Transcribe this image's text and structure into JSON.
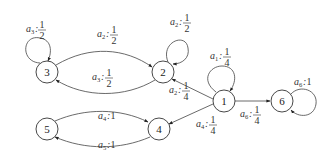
{
  "diagram": {
    "type": "markov-decision-graph",
    "nodes": [
      {
        "id": "1",
        "label": "1",
        "x": 224,
        "y": 101
      },
      {
        "id": "2",
        "label": "2",
        "x": 163,
        "y": 72
      },
      {
        "id": "3",
        "label": "3",
        "x": 47,
        "y": 72
      },
      {
        "id": "4",
        "label": "4",
        "x": 159,
        "y": 129
      },
      {
        "id": "5",
        "label": "5",
        "x": 47,
        "y": 129
      },
      {
        "id": "6",
        "label": "6",
        "x": 282,
        "y": 101
      }
    ],
    "edges": [
      {
        "from": "3",
        "to": "3",
        "action": "a",
        "sub": "3",
        "num": "1",
        "den": "2",
        "kind": "self-loop"
      },
      {
        "from": "3",
        "to": "2",
        "action": "a",
        "sub": "2",
        "num": "1",
        "den": "2",
        "kind": "arc-top"
      },
      {
        "from": "2",
        "to": "3",
        "action": "a",
        "sub": "3",
        "num": "1",
        "den": "2",
        "kind": "arc-bottom"
      },
      {
        "from": "2",
        "to": "2",
        "action": "a",
        "sub": "2",
        "num": "1",
        "den": "2",
        "kind": "self-loop"
      },
      {
        "from": "1",
        "to": "1",
        "action": "a",
        "sub": "1",
        "num": "1",
        "den": "4",
        "kind": "self-loop"
      },
      {
        "from": "1",
        "to": "2",
        "action": "a",
        "sub": "2",
        "num": "1",
        "den": "4",
        "kind": "straight"
      },
      {
        "from": "1",
        "to": "4",
        "action": "a",
        "sub": "4",
        "num": "1",
        "den": "4",
        "kind": "straight"
      },
      {
        "from": "1",
        "to": "6",
        "action": "a",
        "sub": "6",
        "num": "1",
        "den": "4",
        "kind": "straight"
      },
      {
        "from": "6",
        "to": "6",
        "action": "a",
        "sub": "6",
        "value": "1",
        "kind": "self-loop"
      },
      {
        "from": "5",
        "to": "4",
        "action": "a",
        "sub": "4",
        "value": "1",
        "kind": "arc-top"
      },
      {
        "from": "4",
        "to": "5",
        "action": "a",
        "sub": "5",
        "value": "1",
        "kind": "arc-bottom"
      }
    ]
  },
  "labels": {
    "n1": "1",
    "n2": "2",
    "n3": "3",
    "n4": "4",
    "n5": "5",
    "n6": "6",
    "a": "a",
    "colon": ":",
    "sub1": "1",
    "sub2": "2",
    "sub3": "3",
    "sub4": "4",
    "sub5": "5",
    "sub6": "6",
    "one": "1",
    "two": "2",
    "four": "4"
  },
  "colors": {
    "stroke": "#444444",
    "text": "#333333",
    "background": "#ffffff"
  }
}
